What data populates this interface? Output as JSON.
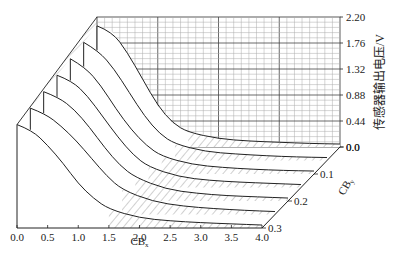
{
  "chart_data": {
    "type": "area",
    "subtype": "3d-waterfall",
    "title": "",
    "xlabel": "CBx",
    "xlabel_main": "CB",
    "xlabel_sub": "x",
    "ylabel": "CBy",
    "ylabel_main": "CB",
    "ylabel_sub": "y",
    "zlabel": "传感器输出电压/V",
    "x_ticks": [
      "0.0",
      "0.5",
      "1.0",
      "1.5",
      "2.0",
      "2.5",
      "3.0",
      "3.5",
      "4.0"
    ],
    "y_ticks": [
      "0.0",
      "0.1",
      "0.2",
      "0.3"
    ],
    "z_ticks": [
      "0.0",
      "0.44",
      "0.88",
      "1.32",
      "1.76",
      "2.20"
    ],
    "xlim": [
      0,
      4
    ],
    "ylim": [
      0,
      0.3
    ],
    "zlim": [
      0,
      2.2
    ],
    "grid": "back-wall",
    "x": [
      0.0,
      0.25,
      0.5,
      0.75,
      1.0,
      1.25,
      1.5,
      2.0,
      2.5,
      3.0,
      3.5,
      4.0
    ],
    "series": [
      {
        "name": "CBy=0.00",
        "values": [
          2.05,
          1.95,
          1.6,
          1.15,
          0.7,
          0.4,
          0.25,
          0.14,
          0.1,
          0.08,
          0.06,
          0.05
        ]
      },
      {
        "name": "CBy=0.05",
        "values": [
          2.0,
          1.85,
          1.55,
          1.15,
          0.75,
          0.45,
          0.28,
          0.15,
          0.11,
          0.08,
          0.06,
          0.05
        ]
      },
      {
        "name": "CBy=0.10",
        "values": [
          1.95,
          1.8,
          1.5,
          1.1,
          0.75,
          0.48,
          0.3,
          0.16,
          0.11,
          0.08,
          0.06,
          0.05
        ]
      },
      {
        "name": "CBy=0.15",
        "values": [
          1.9,
          1.8,
          1.55,
          1.2,
          0.85,
          0.55,
          0.35,
          0.18,
          0.12,
          0.09,
          0.07,
          0.05
        ]
      },
      {
        "name": "CBy=0.20",
        "values": [
          1.85,
          1.75,
          1.55,
          1.25,
          0.9,
          0.6,
          0.4,
          0.2,
          0.13,
          0.09,
          0.07,
          0.05
        ]
      },
      {
        "name": "CBy=0.25",
        "values": [
          1.8,
          1.7,
          1.5,
          1.25,
          0.95,
          0.65,
          0.42,
          0.22,
          0.14,
          0.1,
          0.07,
          0.05
        ]
      },
      {
        "name": "CBy=0.30",
        "values": [
          1.75,
          1.65,
          1.4,
          1.1,
          0.75,
          0.5,
          0.32,
          0.17,
          0.12,
          0.09,
          0.07,
          0.05
        ]
      }
    ]
  }
}
